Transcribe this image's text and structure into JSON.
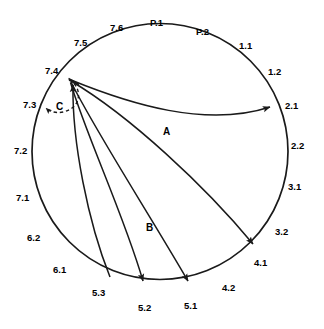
{
  "figure": {
    "type": "circular-flow-diagram",
    "title": "",
    "stroke_color": "#1a1a1a",
    "background_color": "#ffffff",
    "circle": {
      "cx": 160,
      "cy": 151.5,
      "r": 128
    }
  },
  "sector_labels": [
    {
      "id": "P.1",
      "text": "P.1",
      "x": 150,
      "y": 18,
      "angle_deg": 92
    },
    {
      "id": "P.2",
      "text": "P.2",
      "x": 196,
      "y": 27,
      "angle_deg": 72
    },
    {
      "id": "7.6",
      "text": "7.6",
      "x": 110,
      "y": 23,
      "angle_deg": 110
    },
    {
      "id": "7.5",
      "text": "7.5",
      "x": 74,
      "y": 38,
      "angle_deg": 126
    },
    {
      "id": "7.4",
      "text": "7.4",
      "x": 45,
      "y": 66,
      "angle_deg": 147
    },
    {
      "id": "7.3",
      "text": "7.3",
      "x": 23,
      "y": 100,
      "angle_deg": 166
    },
    {
      "id": "7.2",
      "text": "7.2",
      "x": 14,
      "y": 146,
      "angle_deg": 182
    },
    {
      "id": "7.1",
      "text": "7.1",
      "x": 16,
      "y": 193,
      "angle_deg": 198
    },
    {
      "id": "6.2",
      "text": "6.2",
      "x": 27,
      "y": 233,
      "angle_deg": 214
    },
    {
      "id": "6.1",
      "text": "6.1",
      "x": 53,
      "y": 265,
      "angle_deg": 230
    },
    {
      "id": "5.3",
      "text": "5.3",
      "x": 92,
      "y": 288,
      "angle_deg": 248
    },
    {
      "id": "5.2",
      "text": "5.2",
      "x": 138,
      "y": 303,
      "angle_deg": 266
    },
    {
      "id": "5.1",
      "text": "5.1",
      "x": 184,
      "y": 301,
      "angle_deg": 282
    },
    {
      "id": "4.2",
      "text": "4.2",
      "x": 222,
      "y": 283,
      "angle_deg": 298
    },
    {
      "id": "4.1",
      "text": "4.1",
      "x": 254,
      "y": 258,
      "angle_deg": 312
    },
    {
      "id": "3.2",
      "text": "3.2",
      "x": 275,
      "y": 227,
      "angle_deg": 326
    },
    {
      "id": "3.1",
      "text": "3.1",
      "x": 288,
      "y": 182,
      "angle_deg": 343
    },
    {
      "id": "2.2",
      "text": "2.2",
      "x": 291,
      "y": 141,
      "angle_deg": 357
    },
    {
      "id": "2.1",
      "text": "2.1",
      "x": 285,
      "y": 101,
      "angle_deg": 18
    },
    {
      "id": "1.2",
      "text": "1.2",
      "x": 268,
      "y": 67,
      "angle_deg": 36
    },
    {
      "id": "1.1",
      "text": "1.1",
      "x": 239,
      "y": 41,
      "angle_deg": 54
    }
  ],
  "flow_labels": [
    {
      "id": "A",
      "text": "A",
      "x": 163,
      "y": 127
    },
    {
      "id": "B",
      "text": "B",
      "x": 146,
      "y": 223
    },
    {
      "id": "C",
      "text": "C",
      "x": 56,
      "y": 102
    }
  ],
  "flows": [
    {
      "id": "flow-a",
      "label": "A",
      "from": "7.4",
      "to": "2.1",
      "arrowhead": true,
      "style": "solid"
    },
    {
      "id": "flow-to-4-1",
      "label": "",
      "from": "7.4",
      "to": "4.1",
      "arrowhead": true,
      "style": "solid"
    },
    {
      "id": "flow-to-5-1",
      "label": "",
      "from": "7.4",
      "to": "5.1",
      "arrowhead": true,
      "style": "solid"
    },
    {
      "id": "flow-b",
      "label": "B",
      "from": "7.4",
      "to": "5.2",
      "arrowhead": true,
      "style": "solid"
    },
    {
      "id": "flow-from-5-3",
      "label": "",
      "from": "5.3",
      "to": "7.4",
      "arrowhead": true,
      "style": "solid"
    },
    {
      "id": "flow-c-loop",
      "label": "C",
      "from": "7.4",
      "to": "7.3",
      "arrowhead": true,
      "style": "dashed"
    }
  ],
  "hub": {
    "id": "hub-7-4",
    "x": 68.5,
    "y": 78.5,
    "label": "7.4"
  }
}
